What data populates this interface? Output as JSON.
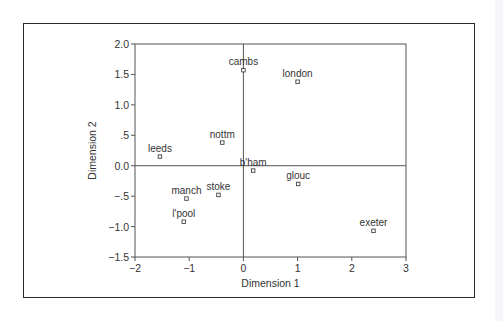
{
  "chart_data": {
    "type": "scatter",
    "title": "",
    "xlabel": "Dimension 1",
    "ylabel": "Dimension 2",
    "xlim": [
      -2,
      3
    ],
    "ylim": [
      -1.5,
      2.0
    ],
    "x_ticks": [
      -2,
      -1,
      0,
      1,
      2,
      3
    ],
    "x_tick_labels": [
      "−2",
      "−1",
      "0",
      "1",
      "2",
      "3"
    ],
    "y_ticks": [
      2.0,
      1.5,
      1.0,
      0.5,
      0.0,
      -0.5,
      -1.0,
      -1.5
    ],
    "y_tick_labels": [
      "2.0",
      "1.5",
      "1.0",
      ".5",
      "0.0",
      "−.5",
      "−1.0",
      "−1.5"
    ],
    "grid": false,
    "reference_lines": {
      "x": 0,
      "y": 0
    },
    "legend": null,
    "points": [
      {
        "label": "cambs",
        "x": 0.0,
        "y": 1.57
      },
      {
        "label": "london",
        "x": 1.0,
        "y": 1.38
      },
      {
        "label": "nottm",
        "x": -0.39,
        "y": 0.38
      },
      {
        "label": "leeds",
        "x": -1.54,
        "y": 0.15
      },
      {
        "label": "b'ham",
        "x": 0.18,
        "y": -0.08
      },
      {
        "label": "glouc",
        "x": 1.01,
        "y": -0.3
      },
      {
        "label": "stoke",
        "x": -0.46,
        "y": -0.48
      },
      {
        "label": "manch",
        "x": -1.05,
        "y": -0.54
      },
      {
        "label": "l'pool",
        "x": -1.1,
        "y": -0.92
      },
      {
        "label": "exeter",
        "x": 2.4,
        "y": -1.07
      }
    ]
  },
  "colors": {
    "axis": "#555555",
    "frame": "#2a2a2a",
    "text": "#333333",
    "marker": "#444444"
  }
}
